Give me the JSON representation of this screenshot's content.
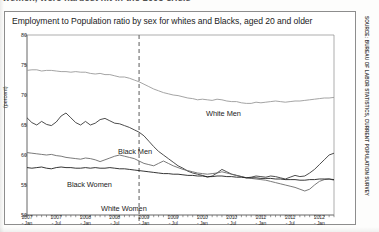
{
  "document": {
    "body_text_cutoff": "women, were hardest hit in the 2008 crisis"
  },
  "sidebar": {
    "credit": "SOURCE: BUREAU OF LABOR STATISTICS, CURRENT POPULATION SURVEY"
  },
  "figure": {
    "title": "Employment to Population ratio by sex for whites and Blacks, aged 20 and older"
  },
  "chart_data": {
    "type": "line",
    "title": "Employment to Population ratio by sex for whites and Blacks, aged 20 and older",
    "xlabel": "",
    "ylabel": "(percent)",
    "ylim": [
      50,
      80
    ],
    "yticks": [
      50,
      55,
      60,
      65,
      70,
      75,
      80
    ],
    "grid": false,
    "legend_position": "inline-labels",
    "annotations": [
      {
        "name": "recession-marker",
        "type": "vertical-dashed-line",
        "x": "2008 - Dec"
      }
    ],
    "x_tick_labels": [
      {
        "year": "2007",
        "month": "Jan"
      },
      {
        "year": "2007",
        "month": "Jul"
      },
      {
        "year": "2008",
        "month": "Jan"
      },
      {
        "year": "2008",
        "month": "Jul"
      },
      {
        "year": "2009",
        "month": "Jan"
      },
      {
        "year": "2009",
        "month": "Jul"
      },
      {
        "year": "2010",
        "month": "Jan"
      },
      {
        "year": "2010",
        "month": "Jul"
      },
      {
        "year": "2011",
        "month": "Jan"
      },
      {
        "year": "2011",
        "month": "Jul"
      },
      {
        "year": "2012",
        "month": "Jan"
      }
    ],
    "x": [
      "2007-01",
      "2007-02",
      "2007-03",
      "2007-04",
      "2007-05",
      "2007-06",
      "2007-07",
      "2007-08",
      "2007-09",
      "2007-10",
      "2007-11",
      "2007-12",
      "2008-01",
      "2008-02",
      "2008-03",
      "2008-04",
      "2008-05",
      "2008-06",
      "2008-07",
      "2008-08",
      "2008-09",
      "2008-10",
      "2008-11",
      "2008-12",
      "2009-01",
      "2009-02",
      "2009-03",
      "2009-04",
      "2009-05",
      "2009-06",
      "2009-07",
      "2009-08",
      "2009-09",
      "2009-10",
      "2009-11",
      "2009-12",
      "2010-01",
      "2010-02",
      "2010-03",
      "2010-04",
      "2010-05",
      "2010-06",
      "2010-07",
      "2010-08",
      "2010-09",
      "2010-10",
      "2010-11",
      "2010-12",
      "2011-01",
      "2011-02",
      "2011-03",
      "2011-04",
      "2011-05",
      "2011-06",
      "2011-07",
      "2011-08",
      "2011-09",
      "2011-10",
      "2011-11",
      "2011-12",
      "2012-01",
      "2012-02",
      "2012-03",
      "2012-04"
    ],
    "series": [
      {
        "name": "White Men",
        "color": "#9a9a9a",
        "label": "White Men",
        "values": [
          74.1,
          74.2,
          74.2,
          74.0,
          74.1,
          74.1,
          74.0,
          73.9,
          73.9,
          73.8,
          73.9,
          73.8,
          73.8,
          73.6,
          73.5,
          73.6,
          73.4,
          73.4,
          73.2,
          73.0,
          73.0,
          72.8,
          72.5,
          72.2,
          71.8,
          71.4,
          71.0,
          70.7,
          70.4,
          70.2,
          70.0,
          69.9,
          69.7,
          69.5,
          69.4,
          69.2,
          69.3,
          69.2,
          69.1,
          69.3,
          69.2,
          69.0,
          68.9,
          68.9,
          68.7,
          68.6,
          68.6,
          68.8,
          68.7,
          68.8,
          68.9,
          69.0,
          68.9,
          68.8,
          68.9,
          69.0,
          69.0,
          69.1,
          69.2,
          69.3,
          69.4,
          69.5,
          69.5,
          69.6
        ]
      },
      {
        "name": "Black Men",
        "color": "#3a3a3a",
        "label": "Black Men",
        "values": [
          66.2,
          65.4,
          65.0,
          65.6,
          65.1,
          64.9,
          65.5,
          66.5,
          67.0,
          66.2,
          65.4,
          65.0,
          65.6,
          65.0,
          65.3,
          65.9,
          66.1,
          65.7,
          65.3,
          65.2,
          64.9,
          64.6,
          64.2,
          63.8,
          63.2,
          62.3,
          61.4,
          60.6,
          60.0,
          59.4,
          58.8,
          58.2,
          57.8,
          57.3,
          57.0,
          56.8,
          56.6,
          56.3,
          56.5,
          57.0,
          57.6,
          57.2,
          56.8,
          56.6,
          56.4,
          56.2,
          56.3,
          56.5,
          56.4,
          56.3,
          56.5,
          56.4,
          56.2,
          56.0,
          56.3,
          56.6,
          56.4,
          56.5,
          57.0,
          57.6,
          58.4,
          59.2,
          60.0,
          60.3
        ]
      },
      {
        "name": "Black Women",
        "color": "#6b6b6b",
        "label": "Black Women",
        "values": [
          60.4,
          60.3,
          60.2,
          60.1,
          60.0,
          60.1,
          59.9,
          59.8,
          59.6,
          59.5,
          59.4,
          59.3,
          59.5,
          59.4,
          59.2,
          58.9,
          59.2,
          59.5,
          59.8,
          60.0,
          59.8,
          59.6,
          59.4,
          59.0,
          58.6,
          58.4,
          58.2,
          58.6,
          59.0,
          58.6,
          58.2,
          57.9,
          57.6,
          57.4,
          57.2,
          57.0,
          56.9,
          56.8,
          56.9,
          57.0,
          57.2,
          57.0,
          56.8,
          56.6,
          56.4,
          56.2,
          56.1,
          56.0,
          55.9,
          55.8,
          55.6,
          55.4,
          55.2,
          55.0,
          54.8,
          54.6,
          54.3,
          54.0,
          54.3,
          55.0,
          55.6,
          55.9,
          56.0,
          55.8
        ]
      },
      {
        "name": "White Women",
        "color": "#1f1f1f",
        "label": "White Women",
        "values": [
          57.9,
          57.8,
          57.9,
          58.0,
          57.8,
          57.7,
          57.9,
          58.0,
          57.9,
          57.9,
          57.8,
          57.8,
          57.9,
          57.8,
          57.9,
          57.8,
          57.8,
          57.9,
          57.8,
          57.7,
          57.7,
          57.6,
          57.5,
          57.4,
          57.3,
          57.2,
          57.1,
          57.0,
          56.9,
          56.9,
          56.8,
          56.8,
          56.7,
          56.6,
          56.6,
          56.5,
          56.5,
          56.4,
          56.4,
          56.5,
          56.5,
          56.4,
          56.4,
          56.3,
          56.3,
          56.2,
          56.2,
          56.2,
          56.1,
          56.1,
          56.1,
          56.0,
          56.0,
          55.9,
          55.9,
          55.9,
          55.8,
          55.8,
          55.9,
          55.9,
          56.0,
          56.0,
          56.0,
          55.9
        ]
      }
    ]
  }
}
